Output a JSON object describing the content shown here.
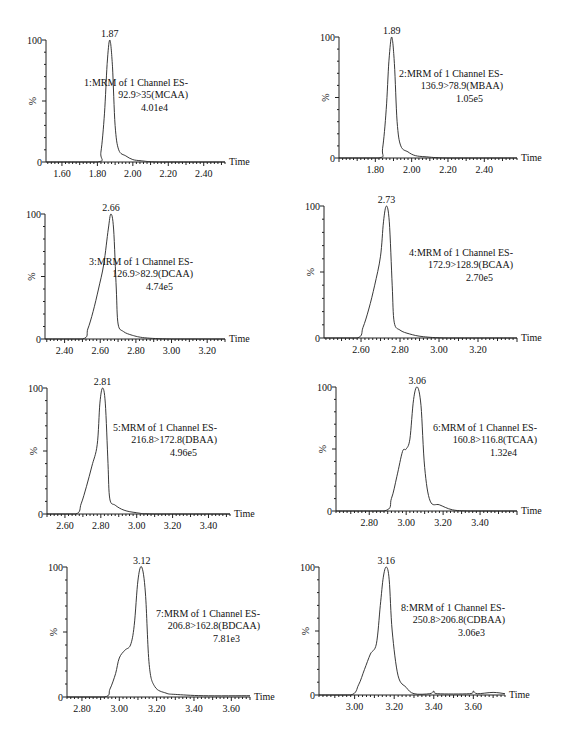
{
  "figure": {
    "ylabel": "%",
    "xlabel": "Time",
    "y_tick_labels": [
      "0",
      "100"
    ]
  },
  "chart_data": [
    {
      "type": "line",
      "title": "1:MRM of 1 Channel ES-",
      "transition": "92.9>35(MCAA)",
      "intensity": "4.01e4",
      "peak_label": "1.87",
      "peak_rt": 1.87,
      "xlabel": "Time",
      "ylabel": "%",
      "xlim": [
        1.51,
        2.52
      ],
      "ylim": [
        0,
        100
      ],
      "x_ticks": [
        1.6,
        1.8,
        2.0,
        2.2,
        2.4
      ],
      "x_tick_labels": [
        "1.60",
        "1.80",
        "2.00",
        "2.20",
        "2.40"
      ],
      "x": [
        1.51,
        1.8,
        1.82,
        1.84,
        1.855,
        1.87,
        1.885,
        1.9,
        1.92,
        1.96,
        2.0,
        2.05,
        2.15,
        2.52
      ],
      "y": [
        0,
        0,
        8,
        40,
        80,
        100,
        78,
        30,
        10,
        5,
        2,
        1,
        0,
        0
      ]
    },
    {
      "type": "line",
      "title": "2:MRM of 1 Channel ES-",
      "transition": "136.9>78.9(MBAA)",
      "intensity": "1.05e5",
      "peak_label": "1.89",
      "peak_rt": 1.89,
      "xlabel": "Time",
      "ylabel": "%",
      "xlim": [
        1.6,
        2.58
      ],
      "ylim": [
        0,
        100
      ],
      "x_ticks": [
        1.8,
        2.0,
        2.2,
        2.4
      ],
      "x_tick_labels": [
        "1.80",
        "2.00",
        "2.20",
        "2.40"
      ],
      "x": [
        1.6,
        1.82,
        1.84,
        1.86,
        1.875,
        1.89,
        1.905,
        1.92,
        1.94,
        1.98,
        2.02,
        2.08,
        2.2,
        2.58
      ],
      "y": [
        0,
        0,
        8,
        40,
        80,
        100,
        78,
        30,
        10,
        5,
        2,
        1,
        0,
        0
      ]
    },
    {
      "type": "line",
      "title": "3:MRM of 1 Channel ES-",
      "transition": "126.9>82.9(DCAA)",
      "intensity": "4.74e5",
      "peak_label": "2.66",
      "peak_rt": 2.66,
      "xlabel": "Time",
      "ylabel": "%",
      "xlim": [
        2.29,
        3.3
      ],
      "ylim": [
        0,
        100
      ],
      "x_ticks": [
        2.4,
        2.6,
        2.8,
        3.0,
        3.2
      ],
      "x_tick_labels": [
        "2.40",
        "2.60",
        "2.80",
        "3.00",
        "3.20"
      ],
      "x": [
        2.29,
        2.5,
        2.53,
        2.56,
        2.59,
        2.62,
        2.645,
        2.66,
        2.675,
        2.69,
        2.7,
        2.73,
        2.78,
        2.85,
        3.0,
        3.3
      ],
      "y": [
        0,
        0,
        8,
        22,
        40,
        60,
        88,
        100,
        88,
        40,
        12,
        6,
        3,
        1,
        0,
        0
      ]
    },
    {
      "type": "line",
      "title": "4:MRM of 1 Channel ES-",
      "transition": "172.9>128.9(BCAA)",
      "intensity": "2.70e5",
      "peak_label": "2.73",
      "peak_rt": 2.73,
      "xlabel": "Time",
      "ylabel": "%",
      "xlim": [
        2.41,
        3.4
      ],
      "ylim": [
        0,
        100
      ],
      "x_ticks": [
        2.6,
        2.8,
        3.0,
        3.2
      ],
      "x_tick_labels": [
        "2.60",
        "2.80",
        "3.00",
        "3.20"
      ],
      "x": [
        2.41,
        2.58,
        2.61,
        2.64,
        2.67,
        2.7,
        2.715,
        2.73,
        2.745,
        2.76,
        2.77,
        2.8,
        2.85,
        2.92,
        3.05,
        3.4
      ],
      "y": [
        0,
        0,
        8,
        22,
        40,
        62,
        88,
        100,
        88,
        40,
        12,
        6,
        3,
        1,
        0,
        0
      ]
    },
    {
      "type": "line",
      "title": "5:MRM of 1 Channel ES-",
      "transition": "216.8>172.8(DBAA)",
      "intensity": "4.96e5",
      "peak_label": "2.81",
      "peak_rt": 2.81,
      "xlabel": "Time",
      "ylabel": "%",
      "xlim": [
        2.5,
        3.52
      ],
      "ylim": [
        0,
        100
      ],
      "x_ticks": [
        2.6,
        2.8,
        3.0,
        3.2,
        3.4
      ],
      "x_tick_labels": [
        "2.60",
        "2.80",
        "3.00",
        "3.20",
        "3.40"
      ],
      "x": [
        2.5,
        2.66,
        2.69,
        2.72,
        2.75,
        2.78,
        2.795,
        2.81,
        2.825,
        2.84,
        2.85,
        2.88,
        2.93,
        3.0,
        3.1,
        3.52
      ],
      "y": [
        0,
        0,
        8,
        22,
        38,
        55,
        88,
        100,
        88,
        40,
        12,
        7,
        3,
        1,
        0,
        0
      ]
    },
    {
      "type": "line",
      "title": "6:MRM of 1 Channel ES-",
      "transition": "160.8>116.8(TCAA)",
      "intensity": "1.32e4",
      "peak_label": "3.06",
      "peak_rt": 3.06,
      "xlabel": "Time",
      "ylabel": "%",
      "xlim": [
        2.62,
        3.6
      ],
      "ylim": [
        0,
        100
      ],
      "x_ticks": [
        2.8,
        3.0,
        3.2,
        3.4
      ],
      "x_tick_labels": [
        "2.80",
        "3.00",
        "3.20",
        "3.40"
      ],
      "x": [
        2.62,
        2.88,
        2.92,
        2.95,
        2.98,
        3.0,
        3.02,
        3.04,
        3.06,
        3.08,
        3.1,
        3.13,
        3.18,
        3.25,
        3.35,
        3.6
      ],
      "y": [
        0,
        0,
        10,
        28,
        48,
        50,
        58,
        90,
        100,
        85,
        35,
        8,
        5,
        1,
        0,
        0
      ]
    },
    {
      "type": "line",
      "title": "7:MRM of 1 Channel ES-",
      "transition": "206.8>162.8(BDCAA)",
      "intensity": "7.81e3",
      "peak_label": "3.12",
      "peak_rt": 3.12,
      "xlabel": "Time",
      "ylabel": "%",
      "xlim": [
        2.72,
        3.7
      ],
      "ylim": [
        0,
        100
      ],
      "x_ticks": [
        2.8,
        3.0,
        3.2,
        3.4,
        3.6
      ],
      "x_tick_labels": [
        "2.80",
        "3.00",
        "3.20",
        "3.40",
        "3.60"
      ],
      "x": [
        2.72,
        2.92,
        2.95,
        2.98,
        3.0,
        3.03,
        3.06,
        3.08,
        3.1,
        3.12,
        3.14,
        3.16,
        3.19,
        3.25,
        3.3,
        3.45,
        3.7
      ],
      "y": [
        0,
        0,
        6,
        18,
        30,
        36,
        40,
        55,
        90,
        100,
        80,
        25,
        8,
        3,
        2,
        1,
        1
      ]
    },
    {
      "type": "line",
      "title": "8:MRM of 1 Channel ES-",
      "transition": "250.8>206.8(CDBAA)",
      "intensity": "3.06e3",
      "peak_label": "3.16",
      "peak_rt": 3.16,
      "xlabel": "Time",
      "ylabel": "%",
      "xlim": [
        2.82,
        3.76
      ],
      "ylim": [
        0,
        100
      ],
      "x_ticks": [
        3.0,
        3.2,
        3.4,
        3.6
      ],
      "x_tick_labels": [
        "3.00",
        "3.20",
        "3.40",
        "3.60"
      ],
      "x": [
        2.82,
        2.98,
        3.02,
        3.05,
        3.08,
        3.11,
        3.13,
        3.145,
        3.16,
        3.175,
        3.19,
        3.22,
        3.26,
        3.3,
        3.38,
        3.4,
        3.42,
        3.58,
        3.6,
        3.62,
        3.7,
        3.76
      ],
      "y": [
        0,
        0,
        8,
        20,
        32,
        40,
        70,
        92,
        100,
        90,
        50,
        15,
        6,
        1,
        1,
        3,
        1,
        1,
        3,
        1,
        2,
        1
      ]
    }
  ],
  "layout": [
    {
      "x0": 46,
      "y0": 162,
      "y100": 40,
      "x1": 225,
      "ann_x": 190,
      "ann_y": 86
    },
    {
      "x0": 339,
      "y0": 158,
      "y100": 37,
      "x1": 517,
      "ann_x": 505,
      "ann_y": 77
    },
    {
      "x0": 45,
      "y0": 339,
      "y100": 214,
      "x1": 225,
      "ann_x": 195,
      "ann_y": 265
    },
    {
      "x0": 324,
      "y0": 338,
      "y100": 206,
      "x1": 517,
      "ann_x": 515,
      "ann_y": 256
    },
    {
      "x0": 47,
      "y0": 514,
      "y100": 388,
      "x1": 230,
      "ann_x": 219,
      "ann_y": 431
    },
    {
      "x0": 336,
      "y0": 511,
      "y100": 387,
      "x1": 517,
      "ann_x": 539,
      "ann_y": 431
    },
    {
      "x0": 67,
      "y0": 697,
      "y100": 567,
      "x1": 250,
      "ann_x": 262,
      "ann_y": 617
    },
    {
      "x0": 319,
      "y0": 695,
      "y100": 567,
      "x1": 505,
      "ann_x": 507,
      "ann_y": 611
    }
  ]
}
